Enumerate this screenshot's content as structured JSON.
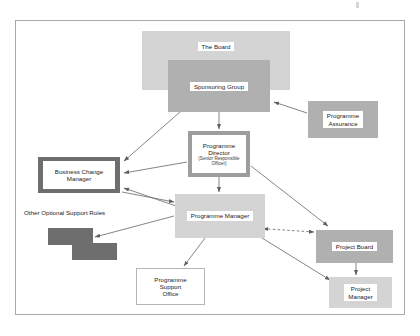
{
  "diagram": {
    "frame": {
      "border_color": "#a9a9a9",
      "background": "#ffffff"
    },
    "palette": {
      "light_gray": "#d4d4d4",
      "medium_gray": "#b0b0b0",
      "dark_gray": "#6e6e6e",
      "border_gray": "#9d9d9d",
      "text": "#1b1b1b",
      "connector": "#6f6f6f"
    },
    "nodes": {
      "board": {
        "label": "The Board",
        "fill": "#d4d4d4"
      },
      "sponsoring_group": {
        "label": "Sponsoring Group",
        "fill": "#b0b0b0"
      },
      "programme_assurance": {
        "label_line1": "Programme",
        "label_line2": "Assurance",
        "fill": "#b0b0b0"
      },
      "programme_director": {
        "title_line1": "Programme",
        "title_line2": "Director",
        "subtitle_line1": "(Senior Responsible",
        "subtitle_line2": "Officer)",
        "fill": "#ffffff",
        "frame_fill": "#9d9d9d"
      },
      "business_change_manager": {
        "label_line1": "Business Change",
        "label_line2": "Manager",
        "fill": "#ffffff",
        "frame_fill": "#6e6e6e"
      },
      "programme_manager": {
        "label": "Programme Manager",
        "fill": "#d4d4d4"
      },
      "programme_support_office": {
        "label_line1": "Programme",
        "label_line2": "Support",
        "label_line3": "Office",
        "fill": "#ffffff"
      },
      "project_board": {
        "label": "Project Board",
        "fill": "#b0b0b0"
      },
      "project_manager": {
        "label_line1": "Project",
        "label_line2": "Manager",
        "fill": "#d4d4d4"
      },
      "optional_support_roles": {
        "label": "Other Optional Support Roles",
        "shape_a_fill": "#6e6e6e",
        "shape_b_fill": "#6e6e6e"
      }
    },
    "connectors": [
      {
        "from": "sponsoring_group",
        "to": "programme_director",
        "style": "solid",
        "arrows": "single"
      },
      {
        "from": "sponsoring_group",
        "to": "business_change_manager",
        "style": "solid",
        "arrows": "single"
      },
      {
        "from": "programme_assurance",
        "to": "sponsoring_group",
        "style": "solid",
        "arrows": "single"
      },
      {
        "from": "programme_director",
        "to": "business_change_manager",
        "style": "solid",
        "arrows": "single"
      },
      {
        "from": "programme_director",
        "to": "programme_manager",
        "style": "solid",
        "arrows": "single"
      },
      {
        "from": "programme_director",
        "to": "project_board",
        "style": "solid",
        "arrows": "single"
      },
      {
        "from": "business_change_manager",
        "to": "programme_manager",
        "style": "solid",
        "arrows": "single"
      },
      {
        "from": "programme_manager",
        "to": "business_change_manager",
        "style": "solid",
        "arrows": "single"
      },
      {
        "from": "programme_manager",
        "to": "optional_support_roles",
        "style": "solid",
        "arrows": "single"
      },
      {
        "from": "programme_manager",
        "to": "programme_support_office",
        "style": "solid",
        "arrows": "single"
      },
      {
        "from": "programme_manager",
        "to": "project_board",
        "style": "dashed",
        "arrows": "double"
      },
      {
        "from": "programme_manager",
        "to": "project_manager",
        "style": "solid",
        "arrows": "single"
      },
      {
        "from": "project_board",
        "to": "project_manager",
        "style": "solid",
        "arrows": "single"
      }
    ]
  }
}
